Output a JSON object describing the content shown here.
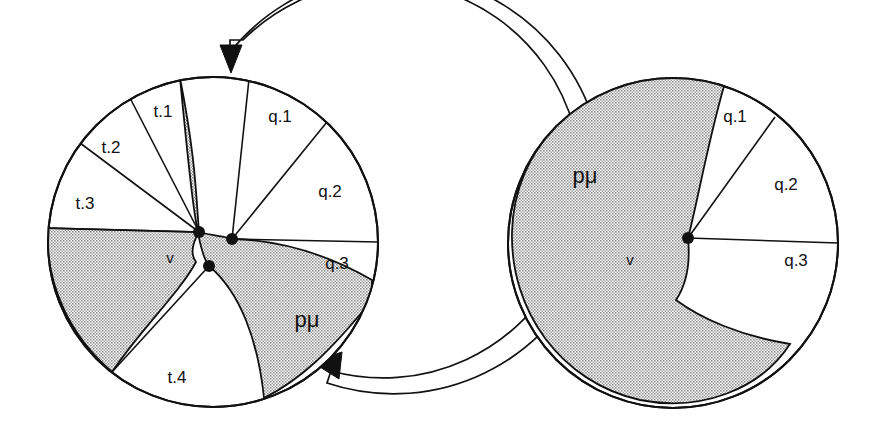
{
  "figure": {
    "background": "#ffffff",
    "ink": "#111111",
    "shade": "#b3b3b3",
    "shade_pattern": "dotted-halftone"
  },
  "diagrams": [
    {
      "id": "left-disc",
      "name": "left-disc-diagram",
      "center": {
        "x": 213,
        "y": 242
      },
      "radius": 165,
      "vertices": [
        {
          "name": "vertex-left",
          "x": 199,
          "y": 232,
          "r": 6
        },
        {
          "name": "vertex-right",
          "x": 232,
          "y": 239,
          "r": 6
        },
        {
          "name": "vertex-lower",
          "x": 209,
          "y": 266,
          "r": 6
        }
      ],
      "vertex_label": "v",
      "vertex_label_pos": {
        "x": 170,
        "y": 263
      },
      "sectors": [
        {
          "label": "t.1",
          "fill": "white",
          "label_pos": {
            "x": 163,
            "y": 117
          }
        },
        {
          "label": "t.2",
          "fill": "white",
          "label_pos": {
            "x": 111,
            "y": 153
          }
        },
        {
          "label": "t.3",
          "fill": "white",
          "label_pos": {
            "x": 85,
            "y": 209
          }
        },
        {
          "label": "t.4",
          "fill": "white",
          "label_pos": {
            "x": 177,
            "y": 383
          }
        },
        {
          "label": "q.1",
          "fill": "white",
          "label_pos": {
            "x": 280,
            "y": 122
          }
        },
        {
          "label": "q.2",
          "fill": "white",
          "label_pos": {
            "x": 330,
            "y": 197
          }
        },
        {
          "label": "q.3",
          "fill": "white",
          "label_pos": {
            "x": 337,
            "y": 269
          }
        },
        {
          "label": "pμ",
          "fill": "shaded",
          "label_pos": {
            "x": 307,
            "y": 327
          }
        }
      ],
      "outer_arc": {
        "name": "rotation-arc",
        "arrows": [
          {
            "name": "arrow-top",
            "direction": "down",
            "tip": {
              "x": 230,
              "y": 58
            }
          },
          {
            "name": "arrow-bottom",
            "direction": "up-left",
            "tip": {
              "x": 317,
              "y": 355
            }
          }
        ]
      }
    },
    {
      "id": "right-disc",
      "name": "right-disc-diagram",
      "center": {
        "x": 673,
        "y": 243
      },
      "radius": 165,
      "vertices": [
        {
          "name": "vertex-center",
          "x": 688,
          "y": 238,
          "r": 6
        }
      ],
      "vertex_label": "v",
      "vertex_label_pos": {
        "x": 630,
        "y": 265
      },
      "sectors": [
        {
          "label": "pμ",
          "fill": "shaded",
          "label_pos": {
            "x": 585,
            "y": 183
          }
        },
        {
          "label": "q.1",
          "fill": "white",
          "label_pos": {
            "x": 735,
            "y": 122
          }
        },
        {
          "label": "q.2",
          "fill": "white",
          "label_pos": {
            "x": 786,
            "y": 190
          }
        },
        {
          "label": "q.3",
          "fill": "white",
          "label_pos": {
            "x": 796,
            "y": 266
          }
        }
      ]
    }
  ]
}
